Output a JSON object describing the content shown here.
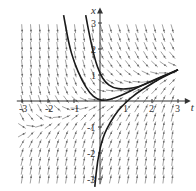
{
  "figure": {
    "type": "direction-field",
    "axes": {
      "horizontal_label": "t",
      "vertical_label": "x",
      "t_ticks": [
        -3,
        -2,
        -1,
        1,
        2,
        3
      ],
      "x_ticks": [
        -3,
        -2,
        -1,
        1,
        2,
        3
      ],
      "t_range": [
        -3.2,
        3.3
      ],
      "x_range": [
        -3.2,
        3.4
      ]
    },
    "colors": {
      "axis": "#333333",
      "arrows": "#8a8a8a",
      "curves": "#1a1a1a",
      "background": "#ffffff"
    },
    "solution_curves": [
      {
        "name": "upper-left-curve",
        "points": [
          [
            -1.4,
            3.3
          ],
          [
            -1.2,
            2.2
          ],
          [
            -1.0,
            1.5
          ],
          [
            -0.7,
            0.8
          ],
          [
            -0.4,
            0.3
          ],
          [
            -0.1,
            0.05
          ],
          [
            0.2,
            0.02
          ],
          [
            0.6,
            0.12
          ],
          [
            1.0,
            0.3
          ],
          [
            1.5,
            0.55
          ],
          [
            2.0,
            0.78
          ],
          [
            2.5,
            1.0
          ],
          [
            3.0,
            1.2
          ]
        ]
      },
      {
        "name": "upper-right-curve",
        "points": [
          [
            -0.55,
            3.3
          ],
          [
            -0.4,
            2.5
          ],
          [
            -0.2,
            1.6
          ],
          [
            0.0,
            1.05
          ],
          [
            0.2,
            0.72
          ],
          [
            0.5,
            0.5
          ],
          [
            0.9,
            0.45
          ],
          [
            1.3,
            0.5
          ],
          [
            1.7,
            0.62
          ],
          [
            2.2,
            0.85
          ],
          [
            2.6,
            1.02
          ],
          [
            3.0,
            1.2
          ]
        ]
      },
      {
        "name": "lower-curve",
        "points": [
          [
            -0.2,
            -3.3
          ],
          [
            -0.1,
            -2.3
          ],
          [
            0.1,
            -1.4
          ],
          [
            0.4,
            -0.8
          ],
          [
            0.7,
            -0.35
          ],
          [
            1.0,
            -0.05
          ],
          [
            1.4,
            0.3
          ],
          [
            1.8,
            0.55
          ],
          [
            2.2,
            0.8
          ],
          [
            2.6,
            1.0
          ],
          [
            3.0,
            1.2
          ]
        ]
      }
    ]
  }
}
